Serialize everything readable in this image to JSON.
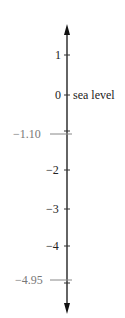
{
  "diagram": {
    "type": "vertical number line",
    "axis_color": "#111111",
    "ticks": [
      {
        "label": "1",
        "value": 1,
        "y": 55
      },
      {
        "label": "0",
        "value": 0,
        "y": 95,
        "annotation": "sea level"
      },
      {
        "label": "−1.10",
        "value": -1.1,
        "y": 133,
        "highlight": true
      },
      {
        "label": "−2",
        "value": -2,
        "y": 170
      },
      {
        "label": "−3",
        "value": -3,
        "y": 209
      },
      {
        "label": "−4",
        "value": -4,
        "y": 246
      },
      {
        "label": "−4.95",
        "value": -4.95,
        "y": 281,
        "highlight": true
      }
    ],
    "annotation": "sea level"
  }
}
